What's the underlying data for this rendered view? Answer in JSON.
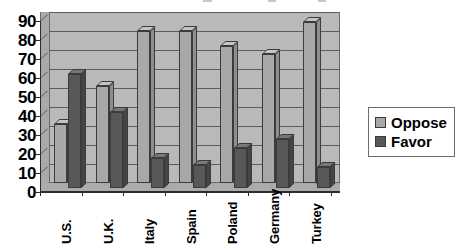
{
  "chart_data": {
    "type": "bar",
    "title": "",
    "xlabel": "",
    "ylabel": "",
    "categories": [
      "U.S.",
      "U.K.",
      "Italy",
      "Spain",
      "Poland",
      "Germany",
      "Turkey"
    ],
    "series": [
      {
        "name": "Oppose",
        "values": [
          31,
          51,
          80,
          80,
          72,
          68,
          85
        ],
        "color": "#a8a8a8"
      },
      {
        "name": "Favor",
        "values": [
          60,
          40,
          16,
          12,
          21,
          26,
          11
        ],
        "color": "#585858"
      }
    ],
    "ylim": [
      0,
      90
    ],
    "ytick_step": 10,
    "ytick_labels": [
      "0",
      "10",
      "20",
      "30",
      "40",
      "50",
      "60",
      "70",
      "80",
      "90"
    ],
    "grid": true,
    "legend_position": "right",
    "style": "3d-clustered-column",
    "plot_background": "#b9b9b9"
  },
  "legend": {
    "items": [
      {
        "label": "Oppose",
        "swatch_color": "#a8a8a8",
        "swatch_name": "legend-swatch-oppose"
      },
      {
        "label": "Favor",
        "swatch_color": "#585858",
        "swatch_name": "legend-swatch-favor"
      }
    ]
  }
}
